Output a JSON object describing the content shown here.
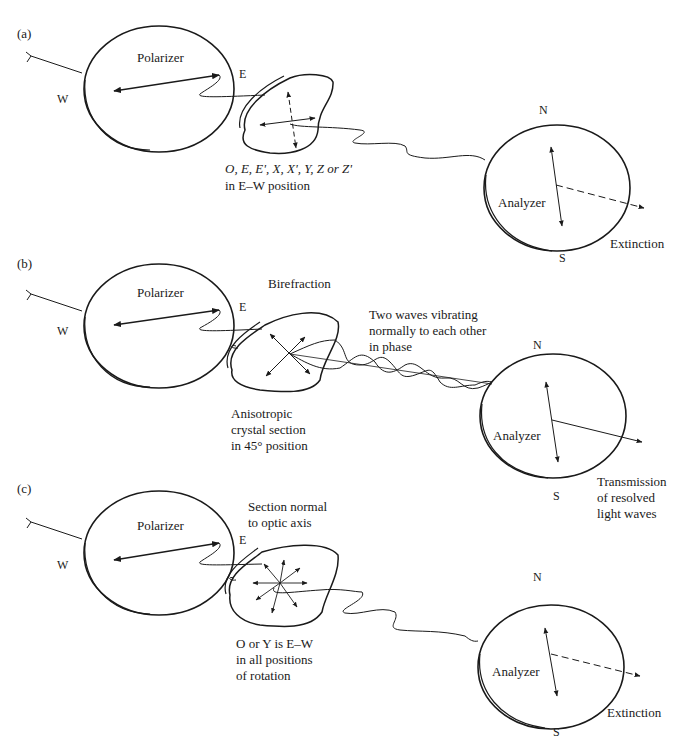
{
  "figure": {
    "panels": [
      {
        "id": "a",
        "label": "(a)",
        "polarizer_label": "Polarizer",
        "west": "W",
        "east": "E",
        "crystal_caption_line1": "O, E, E', X, X', Y, Z or Z'",
        "crystal_caption_line2": "in E–W position",
        "analyzer_label": "Analyzer",
        "north": "N",
        "south": "S",
        "result": "Extinction"
      },
      {
        "id": "b",
        "label": "(b)",
        "polarizer_label": "Polarizer",
        "west": "W",
        "east": "E",
        "top_caption": "Birefraction",
        "wave_caption": "Two waves vibrating\nnormally to each other\nin phase",
        "crystal_caption": "Anisotropic\ncrystal section\nin 45° position",
        "analyzer_label": "Analyzer",
        "north": "N",
        "south": "S",
        "result": "Transmission\nof resolved\nlight waves"
      },
      {
        "id": "c",
        "label": "(c)",
        "polarizer_label": "Polarizer",
        "west": "W",
        "east": "E",
        "top_caption": "Section normal\nto optic axis",
        "crystal_caption": "O or Y is E–W\nin all positions\nof rotation",
        "analyzer_label": "Analyzer",
        "north": "N",
        "south": "S",
        "result": "Extinction"
      }
    ],
    "colors": {
      "ink": "#1a1a1a",
      "background": "#ffffff"
    }
  }
}
